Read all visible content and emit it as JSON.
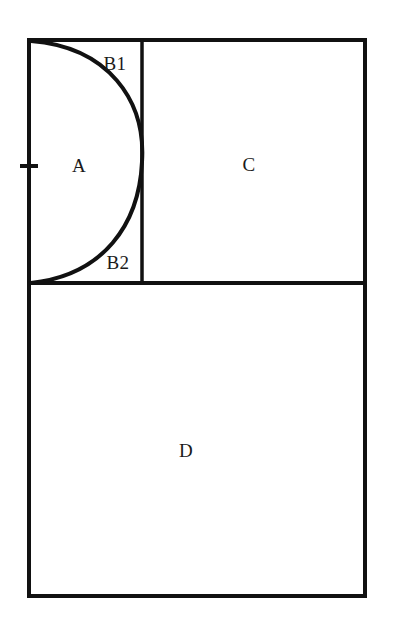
{
  "figure": {
    "background_color": "#ffffff",
    "line_color": "#111111",
    "label_color": "#1a1a1a",
    "outer_rect": {
      "x": 29,
      "y": 40,
      "width": 336,
      "height": 556
    },
    "horizontal_divider": {
      "y": 283,
      "x1": 29,
      "x2": 365
    },
    "vertical_divider": {
      "x": 142,
      "y1": 40,
      "y2": 283
    },
    "arc": {
      "start_x": 31,
      "start_y": 41,
      "end_x": 31,
      "end_y": 283,
      "apex_x": 142,
      "apex_y": 162
    },
    "tick_mark": {
      "x": 29,
      "y": 166,
      "length": 10
    },
    "labels": [
      {
        "id": "A",
        "text": "A",
        "x": 79,
        "y": 168
      },
      {
        "id": "B1",
        "text": "B1",
        "x": 115,
        "y": 66
      },
      {
        "id": "B2",
        "text": "B2",
        "x": 118,
        "y": 265
      },
      {
        "id": "C",
        "text": "C",
        "x": 249,
        "y": 167
      },
      {
        "id": "D",
        "text": "D",
        "x": 186,
        "y": 453
      }
    ]
  }
}
